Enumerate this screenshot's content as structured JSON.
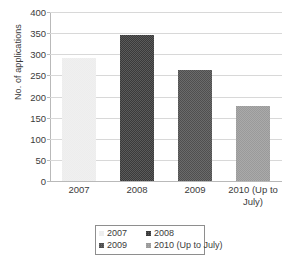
{
  "chart_data": {
    "type": "bar",
    "title": "",
    "subtitle": "",
    "xlabel": "",
    "ylabel": "No. of applications",
    "categories": [
      "2007",
      "2008",
      "2009",
      "2010 (Up to July)"
    ],
    "category_tick_labels": [
      [
        "2007"
      ],
      [
        "2008"
      ],
      [
        "2009"
      ],
      [
        "2010 (Up to",
        "July)"
      ]
    ],
    "values": [
      290,
      345,
      262,
      178
    ],
    "ylim": [
      0,
      400
    ],
    "ytick_step": 50,
    "ytick_labels": [
      "400",
      "350",
      "300",
      "250",
      "200",
      "150",
      "100",
      "50",
      "0"
    ],
    "ytick_values": [
      400,
      350,
      300,
      250,
      200,
      150,
      100,
      50,
      0
    ],
    "grid": true,
    "grid_axis": "y",
    "legend_position": "bottom",
    "legend_entries": [
      {
        "label": "2007",
        "color": "#ededed"
      },
      {
        "label": "2008",
        "color": "#3a3a3a"
      },
      {
        "label": "2009",
        "color": "#4f4f4f"
      },
      {
        "label": "2010 (Up to July)",
        "color": "#9a9a9a"
      }
    ],
    "series": [
      {
        "name": "No. of applications",
        "points": [
          {
            "category": "2007",
            "value": 290,
            "color": "#ededed"
          },
          {
            "category": "2008",
            "value": 345,
            "color": "#3a3a3a"
          },
          {
            "category": "2009",
            "value": 262,
            "color": "#4f4f4f"
          },
          {
            "category": "2010 (Up to July)",
            "value": 178,
            "color": "#9a9a9a"
          }
        ]
      }
    ],
    "colors": {
      "background": "#ffffff",
      "text": "#3b3b3b",
      "gridline": "#d8d8d8",
      "axis": "#b9b9b9",
      "legend_border": "#8e8e8e"
    }
  }
}
